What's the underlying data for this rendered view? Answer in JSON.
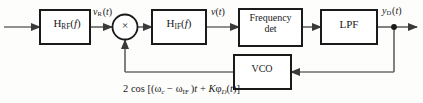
{
  "diagram": {
    "width": 423,
    "height": 103,
    "line_color": "#4a4a4a",
    "border_color": "#1a1a1a",
    "text_color": "#1a1a1a",
    "background": "#fdfdfc"
  },
  "blocks": {
    "rf_filter": {
      "label_html": "H<sub>RF</sub>(<span class=\"ital\">f</span>)",
      "plain": "H_RF(f)"
    },
    "mixer": {
      "label": "×",
      "plain": "multiplier"
    },
    "if_filter": {
      "label_html": "H<sub>IF</sub>(<span class=\"ital\">f</span>)",
      "plain": "H_IF(f)"
    },
    "freq_det": {
      "line1": "Frequency",
      "line2": "det",
      "plain": "Frequency det"
    },
    "lpf": {
      "label": "LPF",
      "plain": "LPF"
    },
    "vco": {
      "label": "VCO",
      "plain": "VCO"
    }
  },
  "signals": {
    "rf_out": {
      "label_html": "<span class=\"ital\">v<sub>R</sub></span>&#8202;(<span class=\"ital\">t</span>)",
      "plain": "v_R(t)"
    },
    "if_out": {
      "label_html": "<span class=\"ital\">v</span>(<span class=\"ital\">t</span>)",
      "plain": "v(t)"
    },
    "detector_out": {
      "label_html": "<span class=\"ital\">y<sub>D</sub></span>&#8202;(<span class=\"ital\">t</span>)",
      "plain": "y_D(t)"
    },
    "vco_out": {
      "label_html": "2 cos [(&omega;<sub><span class=\"ital\">c</span></sub> &minus; &omega;<sub>IF</sub>&#8201;)<span class=\"ital\">t</span> + <span class=\"ital\">K</span>&phi;<sub><span class=\"ital\">D</span></sub>(<span class=\"ital\">t</span>)]",
      "plain": "2 cos [(ω_c − ω_IF)t + Kφ_D(t)]"
    }
  }
}
